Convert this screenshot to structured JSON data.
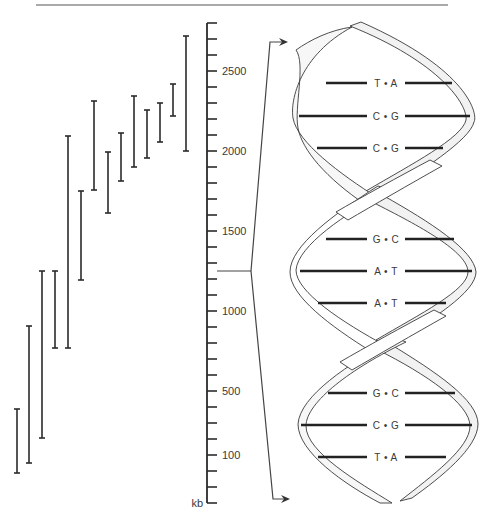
{
  "figure": {
    "top_rule": {
      "x1": 36,
      "x2": 448,
      "y": 5
    },
    "ink_color": "#2b2b2b",
    "ribbon_fill": "#f2f2f2",
    "ribbon_stroke": "#3a3a3a"
  },
  "scale_axis": {
    "unit_label": "kb",
    "x": 207,
    "y_top": 23,
    "y_bottom": 503,
    "tick_spacing": 16,
    "tick_length": 10,
    "labels": [
      {
        "text": "2500",
        "y": 71
      },
      {
        "text": "2000",
        "y": 151
      },
      {
        "text": "1500",
        "y": 231
      },
      {
        "text": "1000",
        "y": 311
      },
      {
        "text": "500",
        "y": 391
      },
      {
        "text": "100",
        "y": 455
      }
    ],
    "pointer_y": 271
  },
  "fragments": {
    "description": "Overlapping DNA fragment intervals drawn as I-bars",
    "bars": [
      {
        "x": 17,
        "top": 409,
        "bottom": 473
      },
      {
        "x": 29,
        "top": 326,
        "bottom": 463
      },
      {
        "x": 42,
        "top": 271,
        "bottom": 438
      },
      {
        "x": 55,
        "top": 271,
        "bottom": 348
      },
      {
        "x": 68,
        "top": 136,
        "bottom": 348
      },
      {
        "x": 81,
        "top": 191,
        "bottom": 280
      },
      {
        "x": 94,
        "top": 101,
        "bottom": 190
      },
      {
        "x": 108,
        "top": 152,
        "bottom": 213
      },
      {
        "x": 121,
        "top": 133,
        "bottom": 181
      },
      {
        "x": 134,
        "top": 96,
        "bottom": 167
      },
      {
        "x": 147,
        "top": 110,
        "bottom": 158
      },
      {
        "x": 160,
        "top": 103,
        "bottom": 142
      },
      {
        "x": 173,
        "top": 84,
        "bottom": 116
      },
      {
        "x": 186,
        "top": 36,
        "bottom": 151
      }
    ]
  },
  "zoom_bracket": {
    "origin": {
      "x": 217,
      "y": 271
    },
    "apex_x": 251,
    "top_arrow": {
      "x": 270,
      "y": 42,
      "tip_x": 288
    },
    "bottom_arrow": {
      "x": 273,
      "y": 499,
      "tip_x": 290
    }
  },
  "helix": {
    "base_pairs": [
      {
        "label": "T • A",
        "y": 83,
        "x1": 326,
        "x2": 452
      },
      {
        "label": "C • G",
        "y": 116,
        "x1": 299,
        "x2": 470
      },
      {
        "label": "C • G",
        "y": 148,
        "x1": 317,
        "x2": 443
      },
      {
        "label": "G • C",
        "y": 239,
        "x1": 326,
        "x2": 454
      },
      {
        "label": "A • T",
        "y": 271,
        "x1": 300,
        "x2": 472
      },
      {
        "label": "A • T",
        "y": 303,
        "x1": 318,
        "x2": 446
      },
      {
        "label": "G • C",
        "y": 393,
        "x1": 328,
        "x2": 455
      },
      {
        "label": "C • G",
        "y": 425,
        "x1": 301,
        "x2": 472
      },
      {
        "label": "T • A",
        "y": 457,
        "x1": 318,
        "x2": 446
      }
    ],
    "label_center_x": 386
  }
}
